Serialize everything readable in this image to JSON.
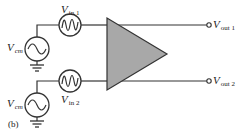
{
  "diagram": {
    "caption": "(b)",
    "amplifier": {
      "fill": "#a8a8a8",
      "stroke": "#333333"
    },
    "sources": {
      "vin1": {
        "symbol": "V",
        "sub": "in 1"
      },
      "vin2": {
        "symbol": "V",
        "sub": "in 2"
      },
      "vcm1": {
        "symbol": "V",
        "sub": "cm"
      },
      "vcm2": {
        "symbol": "V",
        "sub": "cm"
      }
    },
    "outputs": {
      "vout1": {
        "symbol": "V",
        "sub": "out 1"
      },
      "vout2": {
        "symbol": "V",
        "sub": "out 2"
      }
    }
  }
}
